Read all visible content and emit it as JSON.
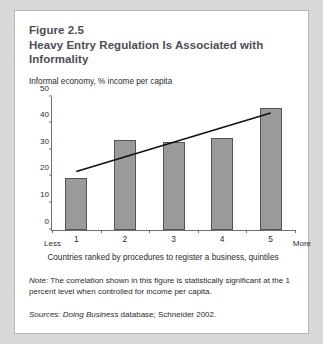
{
  "figure": {
    "number": "Figure 2.5",
    "title": "Heavy Entry Regulation Is Associated with Informality"
  },
  "note": {
    "label": "Note:",
    "text": " The correlation shown in this figure is statistically significant at the 1 percent level when controlled for income per capita."
  },
  "sources": {
    "label": "Sources:",
    "italic_part": " Doing Business",
    "rest": " database; Schneider 2002."
  },
  "axis_endpoints": {
    "left": "Less",
    "right": "More"
  },
  "colors": {
    "bar_fill": "#9a9a9a",
    "bar_stroke": "#555555",
    "axis": "#6f6f6f",
    "trendline": "#111111",
    "title_text": "#4d4d54",
    "page_background": "#d8d8d6",
    "card_background": "#ffffff"
  },
  "chart_data": {
    "type": "bar",
    "title": "Heavy Entry Regulation Is Associated with Informality",
    "subtitle": "",
    "categories": [
      "1",
      "2",
      "3",
      "4",
      "5"
    ],
    "values": [
      19.5,
      33.5,
      33.0,
      34.5,
      45.5
    ],
    "xlabel": "Countries ranked by procedures to register a business, quintiles",
    "ylabel": "Informal economy, % income per capita",
    "ylim": [
      0,
      50
    ],
    "yticks": [
      0,
      10,
      20,
      30,
      40,
      50
    ],
    "grid": false,
    "legend": "none",
    "annotations": [
      {
        "type": "trendline",
        "x_start": 1,
        "y_start": 22.0,
        "x_end": 5,
        "y_end": 44.0
      }
    ]
  }
}
